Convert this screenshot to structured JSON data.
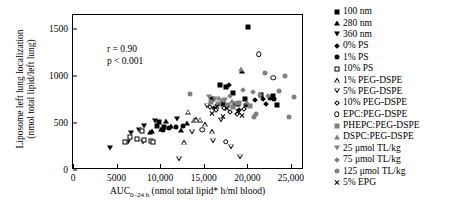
{
  "chart_data": {
    "type": "scatter",
    "title": "",
    "xlabel": "AUC0-24 h (nmol total lipid* h/ml blood)",
    "ylabel_line1": "Liposome left lung localization",
    "ylabel_line2": "(nmol total lipid/left lung)",
    "xlim": [
      0,
      26500
    ],
    "ylim": [
      0,
      1650
    ],
    "xticks": [
      0,
      5000,
      10000,
      15000,
      20000,
      25000
    ],
    "xticklabels": [
      "0",
      "5000",
      "10,000",
      "15,000",
      "20,000",
      "25,000"
    ],
    "yticks": [
      0,
      500,
      1000,
      1500
    ],
    "yticklabels": [
      "0",
      "500",
      "1000",
      "1500"
    ],
    "grid": false,
    "legend_position": "right-outside",
    "annotations": [
      "r = 0.90",
      "p < 0.001"
    ],
    "series": [
      {
        "name": "100 nm",
        "marker": "filled-square",
        "points": [
          [
            20100,
            1520
          ],
          [
            9600,
            470
          ],
          [
            17600,
            880
          ],
          [
            16900,
            900
          ],
          [
            18300,
            820
          ],
          [
            19700,
            760
          ],
          [
            21600,
            800
          ],
          [
            22900,
            790
          ],
          [
            15900,
            760
          ],
          [
            17200,
            700
          ],
          [
            10400,
            460
          ],
          [
            9900,
            510
          ],
          [
            18900,
            700
          ],
          [
            23400,
            690
          ]
        ]
      },
      {
        "name": "280 nm",
        "marker": "filled-triangle-up",
        "points": [
          [
            9100,
            420
          ],
          [
            10100,
            440
          ],
          [
            11200,
            470
          ],
          [
            8800,
            400
          ],
          [
            12400,
            430
          ],
          [
            13100,
            500
          ],
          [
            10700,
            520
          ],
          [
            19400,
            1050
          ]
        ]
      },
      {
        "name": "360 nm",
        "marker": "filled-triangle-down",
        "points": [
          [
            4300,
            230
          ],
          [
            6700,
            390
          ],
          [
            8200,
            470
          ],
          [
            7600,
            430
          ],
          [
            9400,
            520
          ],
          [
            11900,
            540
          ],
          [
            8000,
            300
          ],
          [
            6300,
            300
          ]
        ]
      },
      {
        "name": "0% PS",
        "marker": "filled-diamond",
        "points": [
          [
            20900,
            740
          ],
          [
            17900,
            900
          ],
          [
            21800,
            760
          ],
          [
            18600,
            700
          ],
          [
            16200,
            660
          ],
          [
            19100,
            640
          ],
          [
            22100,
            700
          ]
        ]
      },
      {
        "name": "1% PS",
        "marker": "filled-circle",
        "points": [
          [
            11000,
            450
          ],
          [
            11800,
            460
          ],
          [
            12600,
            470
          ],
          [
            10300,
            430
          ],
          [
            22600,
            770
          ],
          [
            23100,
            760
          ],
          [
            19800,
            690
          ]
        ]
      },
      {
        "name": "10% PS",
        "marker": "open-square",
        "points": [
          [
            7300,
            330
          ],
          [
            8100,
            320
          ],
          [
            8900,
            310
          ],
          [
            6500,
            350
          ],
          [
            7900,
            420
          ],
          [
            9200,
            300
          ],
          [
            6000,
            300
          ]
        ]
      },
      {
        "name": "1% PEG-DSPE",
        "marker": "open-triangle-up",
        "points": [
          [
            13200,
            620
          ],
          [
            13900,
            590
          ],
          [
            14600,
            640
          ],
          [
            14100,
            700
          ],
          [
            15200,
            700
          ],
          [
            12700,
            560
          ],
          [
            16000,
            730
          ]
        ]
      },
      {
        "name": "5% PEG-DSPE",
        "marker": "open-triangle-down",
        "points": [
          [
            15400,
            1050
          ],
          [
            13700,
            830
          ],
          [
            17000,
            1010
          ],
          [
            16100,
            840
          ],
          [
            18100,
            830
          ],
          [
            12200,
            760
          ],
          [
            19200,
            830
          ]
        ]
      },
      {
        "name": "10% PEG-DSPE",
        "marker": "open-diamond",
        "points": [
          [
            16400,
            640
          ],
          [
            17300,
            660
          ],
          [
            18000,
            620
          ],
          [
            15700,
            670
          ],
          [
            19600,
            650
          ],
          [
            18800,
            600
          ]
        ]
      },
      {
        "name": "EPC:PEG-DSPE",
        "marker": "open-circle",
        "points": [
          [
            21300,
            1230
          ],
          [
            23000,
            980
          ],
          [
            17500,
            300
          ],
          [
            14800,
            430
          ]
        ]
      },
      {
        "name": "PHEPC:PEG-DSPE",
        "marker": "gray-square",
        "points": [
          [
            16600,
            700
          ],
          [
            17800,
            690
          ],
          [
            18400,
            670
          ],
          [
            19000,
            710
          ],
          [
            20300,
            680
          ],
          [
            15800,
            720
          ]
        ]
      },
      {
        "name": "DSPC:PEG-DSPE",
        "marker": "gray-triangle-up",
        "points": [
          [
            19300,
            1080
          ],
          [
            17100,
            750
          ],
          [
            18200,
            730
          ],
          [
            16800,
            770
          ],
          [
            20000,
            720
          ]
        ]
      },
      {
        "name": "25 umol TL/kg",
        "marker": "gray-triangle-down",
        "points": [
          [
            16300,
            760
          ],
          [
            17400,
            740
          ],
          [
            18700,
            700
          ],
          [
            15600,
            780
          ]
        ]
      },
      {
        "name": "75 umol TL/kg",
        "marker": "gray-diamond",
        "points": [
          [
            20600,
            830
          ],
          [
            21400,
            800
          ],
          [
            22400,
            790
          ],
          [
            19500,
            850
          ],
          [
            18000,
            790
          ]
        ]
      },
      {
        "name": "125 umol TL/kg",
        "marker": "gray-circle",
        "points": [
          [
            24300,
            1000
          ],
          [
            25300,
            780
          ],
          [
            22000,
            1030
          ],
          [
            23600,
            840
          ],
          [
            21000,
            600
          ],
          [
            24800,
            560
          ],
          [
            13400,
            810
          ],
          [
            20800,
            560
          ]
        ]
      },
      {
        "name": "5% EPG",
        "marker": "cross-x",
        "points": [
          [
            16500,
            680
          ],
          [
            17700,
            650
          ],
          [
            18900,
            620
          ],
          [
            15900,
            600
          ],
          [
            19400,
            580
          ],
          [
            17200,
            570
          ]
        ]
      }
    ]
  },
  "legend": {
    "items": [
      {
        "label": "100 nm",
        "marker": "filled-square"
      },
      {
        "label": "280 nm",
        "marker": "filled-triangle-up"
      },
      {
        "label": "360 nm",
        "marker": "filled-triangle-down"
      },
      {
        "label": "0% PS",
        "marker": "filled-diamond"
      },
      {
        "label": "1% PS",
        "marker": "filled-circle"
      },
      {
        "label": "10% PS",
        "marker": "open-square"
      },
      {
        "label": "1% PEG-DSPE",
        "marker": "open-triangle-up"
      },
      {
        "label": "5% PEG-DSPE",
        "marker": "open-triangle-down"
      },
      {
        "label": "10% PEG-DSPE",
        "marker": "open-diamond"
      },
      {
        "label": "EPC:PEG-DSPE",
        "marker": "open-circle"
      },
      {
        "label": "PHEPC:PEG-DSPE",
        "marker": "gray-square"
      },
      {
        "label": "DSPC:PEG-DSPE",
        "marker": "gray-triangle-up"
      },
      {
        "label": "25 μmol TL/kg",
        "marker": "gray-triangle-down"
      },
      {
        "label": "75 μmol TL/kg",
        "marker": "gray-diamond"
      },
      {
        "label": "125 μmol TL/kg",
        "marker": "gray-circle"
      },
      {
        "label": "5% EPG",
        "marker": "cross-x"
      }
    ]
  },
  "colors": {
    "ink": "#000000",
    "gray": "#808080",
    "background": "#ffffff"
  }
}
